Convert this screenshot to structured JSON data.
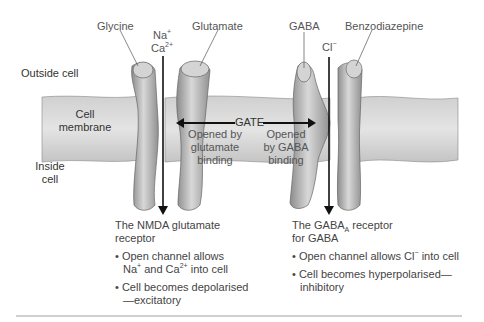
{
  "labels": {
    "glycine": "Glycine",
    "glutamate": "Glutamate",
    "gaba": "GABA",
    "benzodiazepine": "Benzodiazepine",
    "na": "Na",
    "na_sup": "+",
    "ca": "Ca",
    "ca_sup": "2+",
    "cl": "Cl",
    "cl_sup": "−",
    "outside_cell": "Outside cell",
    "cell_membrane_1": "Cell",
    "cell_membrane_2": "membrane",
    "inside_cell_1": "Inside",
    "inside_cell_2": "cell",
    "gate": "GATE",
    "opened_glutamate": [
      "Opened by",
      "glutamate",
      "binding"
    ],
    "opened_gaba": [
      "Opened",
      "by GABA",
      "binding"
    ]
  },
  "nmda": {
    "title_1": "The NMDA glutamate",
    "title_2": "receptor",
    "bullet1_a": "• Open channel allows",
    "bullet1_b1": "Na",
    "bullet1_b1_sup": "+",
    "bullet1_b2": " and Ca",
    "bullet1_b2_sup": "2+",
    "bullet1_b3": " into cell",
    "bullet2_a": "• Cell becomes depolarised",
    "bullet2_b": "—excitatory"
  },
  "gabaa": {
    "title_a": "The GABA",
    "title_sub": "A",
    "title_b": " receptor",
    "title_2": "for GABA",
    "bullet1_a": "• Open channel allows Cl",
    "bullet1_sup": "−",
    "bullet1_b": " into cell",
    "bullet2_a": "• Cell becomes hyperpolarised—",
    "bullet2_b": "inhibitory"
  },
  "colors": {
    "membrane": "#c8c8c8",
    "protein": "#a8a8a8",
    "arrow": "#111111"
  }
}
